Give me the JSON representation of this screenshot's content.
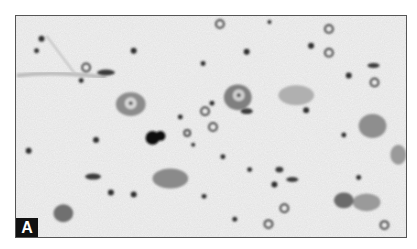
{
  "figure": {
    "panel_label": "A",
    "colors": {
      "background": "#e6e6e6",
      "neuropil_light": "#f2f2f2",
      "cell_body": "#8a8a8a",
      "nucleus_dark": "#2a2a2a",
      "label_bg": "#111111",
      "label_fg": "#ffffff"
    }
  }
}
